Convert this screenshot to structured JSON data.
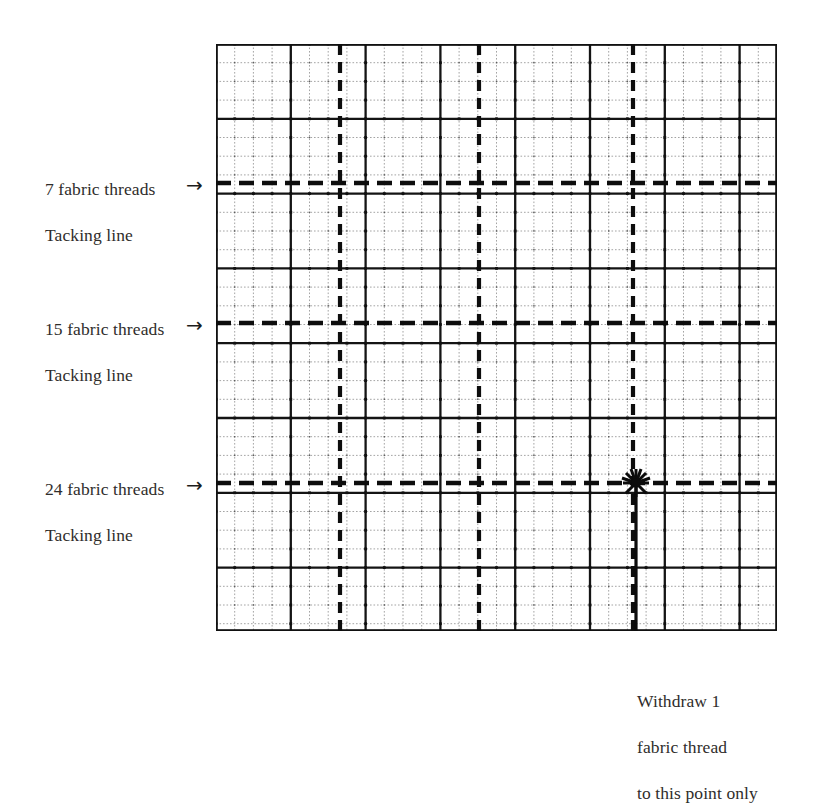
{
  "figure": {
    "background": "#ffffff",
    "ink_color": "#1c1c1c",
    "text_color": "#2f2d2b"
  },
  "grid": {
    "left": 216,
    "top": 44,
    "width": 561,
    "height": 587,
    "cell_size": 18.7,
    "columns": 30,
    "rows": 31,
    "heavy_every": 4,
    "border": true
  },
  "annotations": {
    "left_labels": [
      {
        "name": "tacking-line-7",
        "line1": "7 fabric threads",
        "line2": "Tacking line",
        "arrow": "→",
        "y": 183
      },
      {
        "name": "tacking-line-15",
        "line1": "15 fabric threads",
        "line2": "Tacking line",
        "arrow": "→",
        "y": 323
      },
      {
        "name": "tacking-line-24",
        "line1": "24 fabric threads",
        "line2": "Tacking line",
        "arrow": "→",
        "y": 483
      }
    ],
    "bottom_right_label": {
      "name": "withdraw-thread-note",
      "line1": "Withdraw 1",
      "line2": "fabric thread",
      "line3": "to this point only"
    }
  },
  "chart_data": {
    "type": "diagram",
    "grid": {
      "x0": 216,
      "y0": 44,
      "x1": 777,
      "y1": 631,
      "cell": 18.7,
      "cols": 30,
      "rows": 31,
      "minor_line_color": "#8a8a8a",
      "major_line_color": "#111111",
      "major_interval": 4
    },
    "horizontal_tacking_lines": [
      {
        "label": "7 fabric threads Tacking line",
        "y": 183,
        "style": "dashed",
        "x_start": 216,
        "x_end": 777
      },
      {
        "label": "15 fabric threads Tacking line",
        "y": 323,
        "style": "dashed",
        "x_start": 216,
        "x_end": 777
      },
      {
        "label": "24 fabric threads Tacking line",
        "y": 483,
        "style": "dashed",
        "x_start": 216,
        "x_end": 777
      }
    ],
    "vertical_tacking_lines": [
      {
        "x": 340,
        "style": "dashed",
        "y_start": 44,
        "y_end": 631
      },
      {
        "x": 479,
        "style": "dashed",
        "y_start": 44,
        "y_end": 631
      },
      {
        "x": 633,
        "style": "dashed",
        "y_start": 44,
        "y_end": 631
      }
    ],
    "withdraw_arrow": {
      "x": 636,
      "y_tail": 645,
      "y_head": 483,
      "head_style": "starburst",
      "note": "Withdraw 1 fabric thread to this point only"
    },
    "legend": [],
    "xlabel": "",
    "ylabel": ""
  }
}
